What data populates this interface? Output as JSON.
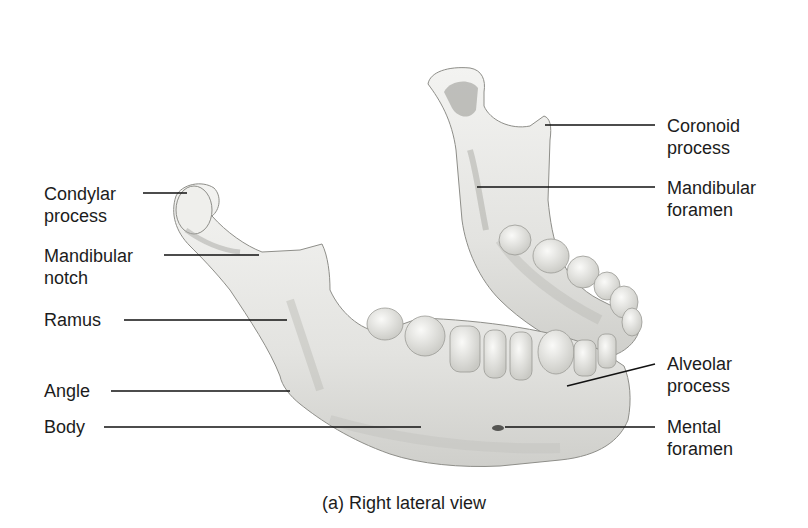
{
  "figure": {
    "caption": "(a) Right lateral view",
    "colors": {
      "background": "#ffffff",
      "bone": "#e9e9e6",
      "bone_shadow": "#bdbdb8",
      "leader_line": "#111111",
      "text": "#1c1c1c"
    }
  },
  "labels_left": [
    {
      "id": "condylar-process",
      "line1": "Condylar",
      "line2": "process"
    },
    {
      "id": "mandibular-notch",
      "line1": "Mandibular",
      "line2": "notch"
    },
    {
      "id": "ramus",
      "line1": "Ramus",
      "line2": ""
    },
    {
      "id": "angle",
      "line1": "Angle",
      "line2": ""
    },
    {
      "id": "body",
      "line1": "Body",
      "line2": ""
    }
  ],
  "labels_right": [
    {
      "id": "coronoid-process",
      "line1": "Coronoid",
      "line2": "process"
    },
    {
      "id": "mandibular-foramen",
      "line1": "Mandibular",
      "line2": "foramen"
    },
    {
      "id": "alveolar-process",
      "line1": "Alveolar",
      "line2": "process"
    },
    {
      "id": "mental-foramen",
      "line1": "Mental",
      "line2": "foramen"
    }
  ]
}
